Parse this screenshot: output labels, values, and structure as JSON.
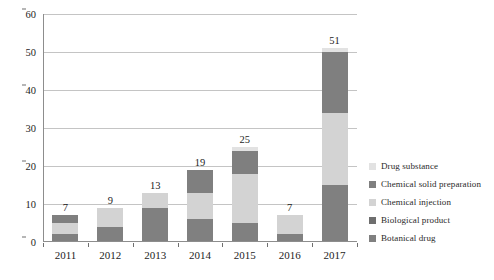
{
  "chart_data": {
    "type": "bar",
    "stacked": true,
    "title": "",
    "xlabel": "",
    "ylabel": "",
    "categories": [
      "2011",
      "2012",
      "2013",
      "2014",
      "2015",
      "2016",
      "2017"
    ],
    "ylim": [
      0,
      60
    ],
    "yticks": [
      0,
      10,
      20,
      30,
      40,
      50,
      60
    ],
    "ytick_labels": [
      "0",
      "10",
      "20",
      "30",
      "40",
      "50",
      "60"
    ],
    "grid": true,
    "legend_position": "right",
    "totals": [
      7,
      9,
      13,
      19,
      25,
      7,
      51
    ],
    "total_labels": [
      "7",
      "9",
      "13",
      "19",
      "25",
      "7",
      "51"
    ],
    "series": [
      {
        "name": "Botanical drug",
        "color": "#808080",
        "values": [
          2,
          4,
          9,
          6,
          5,
          2,
          15
        ]
      },
      {
        "name": "Biological product",
        "color": "#6e6e6e",
        "values": [
          0,
          0,
          0,
          0,
          0,
          0,
          0
        ]
      },
      {
        "name": "Chemical injection",
        "color": "#d3d3d3",
        "values": [
          3,
          5,
          4,
          7,
          13,
          5,
          19
        ]
      },
      {
        "name": "Chemical solid preparation",
        "color": "#7f7f7f",
        "values": [
          2,
          0,
          0,
          6,
          6,
          0,
          16
        ]
      },
      {
        "name": "Drug substance",
        "color": "#e2e2e2",
        "values": [
          0,
          0,
          0,
          0,
          1,
          0,
          1
        ]
      }
    ]
  },
  "legend": {
    "items": [
      {
        "label": "Drug substance",
        "color": "#e2e2e2"
      },
      {
        "label": "Chemical solid preparation",
        "color": "#7f7f7f"
      },
      {
        "label": "Chemical injection",
        "color": "#d3d3d3"
      },
      {
        "label": "Biological product",
        "color": "#6e6e6e"
      },
      {
        "label": "Botanical drug",
        "color": "#808080"
      }
    ]
  },
  "axes": {
    "grid_color": "#c4c4c4",
    "axis_color": "#8d8d8d"
  }
}
